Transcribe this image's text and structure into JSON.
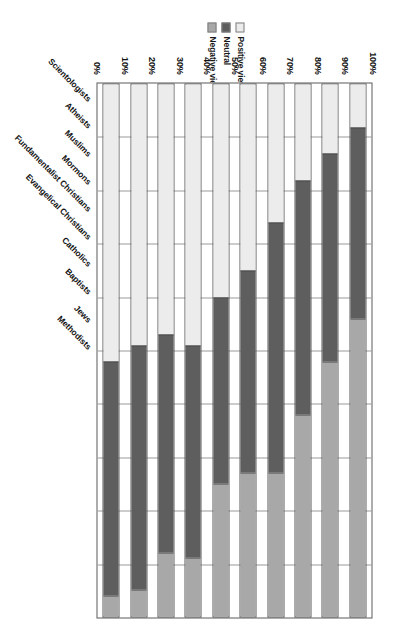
{
  "chart_data": {
    "type": "bar",
    "subtype": "stacked-horizontal-100pct",
    "title": "",
    "xlabel": "",
    "ylabel": "",
    "orientation": "rotated-90ccw",
    "axis_direction": "100% at left to 0% at right",
    "grid": true,
    "legend_position": "top-center",
    "xlim": [
      0,
      100
    ],
    "tick_labels": [
      "100%",
      "90%",
      "80%",
      "70%",
      "60%",
      "50%",
      "40%",
      "30%",
      "20%",
      "10%",
      "0%"
    ],
    "categories": [
      "Scientologists",
      "Atheists",
      "Muslims",
      "Mormons",
      "Fundamentalist Christians",
      "Evangelical Christians",
      "Catholics",
      "Baptists",
      "Jews",
      "Methodists"
    ],
    "series": [
      {
        "name": "Positive view",
        "color": "#ececec",
        "values": [
          8,
          13,
          18,
          26,
          35,
          40,
          49,
          47,
          49,
          52
        ]
      },
      {
        "name": "Neutral",
        "color": "#5e5e5e",
        "values": [
          36,
          39,
          44,
          47,
          38,
          35,
          40,
          41,
          46,
          44
        ]
      },
      {
        "name": "Negative view",
        "color": "#a8a8a8",
        "values": [
          56,
          48,
          38,
          27,
          27,
          25,
          11,
          12,
          5,
          4
        ]
      }
    ]
  },
  "legend": {
    "items": [
      {
        "label": "Positive view",
        "swatch": "#ececec"
      },
      {
        "label": "Neutral",
        "swatch": "#5e5e5e"
      },
      {
        "label": "Negative view",
        "swatch": "#a8a8a8"
      }
    ]
  },
  "colors": {
    "positive": "#ececec",
    "neutral": "#5e5e5e",
    "negative": "#a8a8a8",
    "grid": "#9a9a9a",
    "frame": "#5a5a5a",
    "text": "#111111",
    "background": "#ffffff"
  }
}
